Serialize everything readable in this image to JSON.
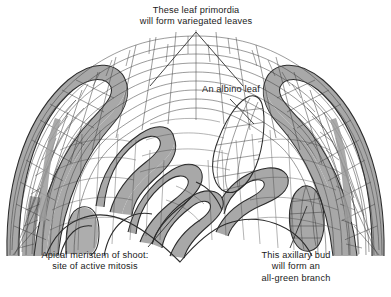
{
  "diagram": {
    "background_color": "#ffffff",
    "cell_outline_color": "#3a3a3a",
    "green_cell_color": "#a9a9a9",
    "white_cell_color": "#ffffff",
    "leader_line_color": "#3a3a3a",
    "text_color": "#1a1a1a"
  },
  "labels": {
    "variegated": "These leaf primordia\nwill form variegated leaves",
    "albino": "An albino leaf",
    "meristem": "Apical meristem of shoot:\nsite of active mitosis",
    "axillary": "This axillary bud\nwill form an\nall-green branch"
  },
  "structures": {
    "outer_left_leaf": "variegated leaf primordium, left",
    "outer_right_leaf": "variegated leaf primordium, right",
    "albino_leaf": "albino leaf primordium",
    "apical_dome": "apical meristem dome",
    "axillary_bud": "all-green axillary bud"
  }
}
